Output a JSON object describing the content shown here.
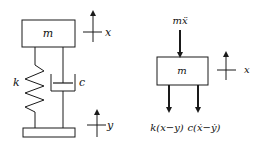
{
  "diagram": {
    "title": "",
    "left": {
      "mass_label": "m",
      "spring_label": "k",
      "damper_label": "c",
      "mass_displacement_label": "x",
      "base_displacement_label": "y"
    },
    "right": {
      "inertia_force_label": "mẍ",
      "mass_label": "m",
      "displacement_label": "x",
      "spring_force_label": "k(x−y)",
      "damper_force_label": "c(ẋ−ẏ)"
    },
    "colors": {
      "line": "#1a1a1a",
      "background": "#ffffff"
    }
  }
}
